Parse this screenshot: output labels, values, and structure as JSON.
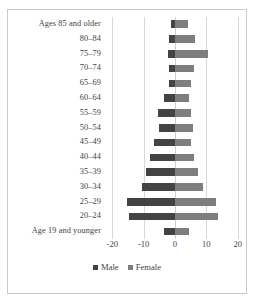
{
  "chart_data": {
    "type": "bar",
    "subtype": "population-pyramid",
    "title": "",
    "xlabel": "",
    "ylabel": "",
    "categories": [
      "Ages 85 and older",
      "80–84",
      "75–79",
      "70–74",
      "65–69",
      "60–64",
      "55–59",
      "50–54",
      "45–49",
      "40–44",
      "35–39",
      "30–34",
      "25–29",
      "20–24",
      "Age 19 and younger"
    ],
    "series": [
      {
        "name": "Male",
        "color": "#434343",
        "values": [
          -1.2,
          -2.0,
          -2.2,
          -1.8,
          -1.9,
          -3.4,
          -5.4,
          -5.0,
          -6.6,
          -8.0,
          -9.4,
          -10.6,
          -15.2,
          -14.8,
          -3.6
        ]
      },
      {
        "name": "Female",
        "color": "#7e7e7e",
        "values": [
          4.0,
          6.4,
          10.6,
          6.2,
          5.2,
          4.4,
          5.2,
          5.6,
          5.0,
          6.0,
          7.2,
          8.8,
          13.0,
          13.8,
          4.4
        ]
      }
    ],
    "xticks": [
      -20,
      -10,
      0,
      10,
      20
    ],
    "xticklabels": [
      "-20",
      "-10",
      "0",
      "10",
      "20"
    ],
    "xlim": [
      -22,
      22
    ],
    "grid": true,
    "legend": {
      "position": "bottom",
      "entries": [
        {
          "label": "Male",
          "color": "#434343",
          "swatch": "square-swatch"
        },
        {
          "label": "Female",
          "color": "#7e7e7e",
          "swatch": "square-swatch"
        }
      ]
    }
  },
  "colors": {
    "male": "#434343",
    "female": "#7e7e7e",
    "gridline": "#d8d8d8",
    "frame": "#c9c9c9",
    "text": "#3f3f3f",
    "background": "#ffffff"
  }
}
